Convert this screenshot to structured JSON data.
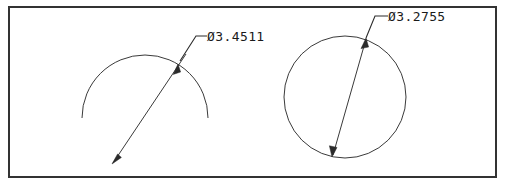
{
  "drawing": {
    "title": "CAD diameter dimension drawing",
    "background_color": "#ffffff",
    "line_color": "#3a3a3a",
    "text_color": "#1a1a1a",
    "border": {
      "label": "drawing-frame",
      "x": 8,
      "y": 6,
      "width": 489,
      "height": 172,
      "color": "#333333",
      "stroke_width": 2
    },
    "features": [
      {
        "id": "left-arc",
        "kind": "arc",
        "center_x": 145,
        "center_y": 118,
        "radius": 63,
        "start_angle_deg": 180,
        "end_angle_deg": 360,
        "dimension": {
          "label": "Ø3.4511",
          "value": 3.4511,
          "symbol": "Ø",
          "text_x": 207,
          "text_y": 41,
          "leader_elbow_x": 196,
          "leader_elbow_y": 36,
          "leader_tip_x": 178,
          "leader_tip_y": 65,
          "arrow_top_x": 178,
          "arrow_top_y": 65,
          "arrow_bottom_x": 113,
          "arrow_bottom_y": 163
        }
      },
      {
        "id": "right-circle",
        "kind": "circle",
        "center_x": 345,
        "center_y": 97,
        "radius": 61,
        "dimension": {
          "label": "Ø3.2755",
          "value": 3.2755,
          "symbol": "Ø",
          "text_x": 388,
          "text_y": 21,
          "leader_elbow_x": 375,
          "leader_elbow_y": 16,
          "leader_tip_x": 365,
          "leader_tip_y": 41,
          "arrow_top_x": 365,
          "arrow_top_y": 41,
          "arrow_bottom_x": 333,
          "arrow_bottom_y": 155
        }
      }
    ]
  }
}
